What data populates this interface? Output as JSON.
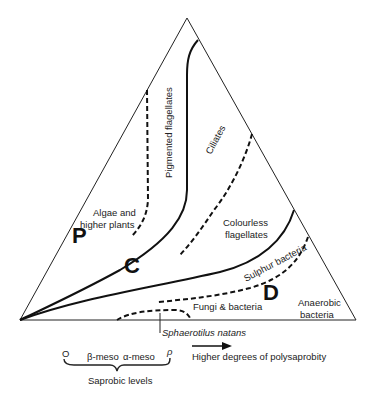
{
  "diagram": {
    "regions": {
      "p": "P",
      "c": "C",
      "d": "D"
    },
    "labels": {
      "pigmented_flagellates": "Pigmented flagellates",
      "ciliates": "Ciliates",
      "algae_line1": "Algae and",
      "algae_line2": "higher plants",
      "colourless_line1": "Colourless",
      "colourless_line2": "flagellates",
      "sulphur_bacteria": "Sulphur bacteria",
      "fungi_bacteria": "Fungi & bacteria",
      "anaerobic_line1": "Anaerobic",
      "anaerobic_line2": "bacteria",
      "sphaerotilus": "Sphaerotilus natans"
    },
    "legend": {
      "level_o": "O",
      "level_beta": "β-meso",
      "level_alpha": "α-meso",
      "level_rho": "ρ",
      "saprobic_levels": "Saprobic levels",
      "arrow_text": "Higher degrees of polysaprobity"
    }
  }
}
